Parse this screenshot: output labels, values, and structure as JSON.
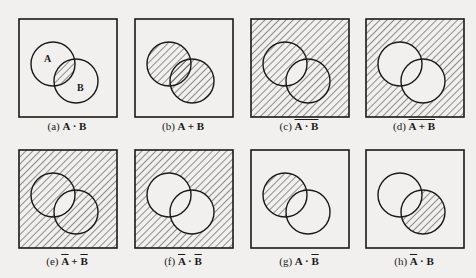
{
  "figure": {
    "colors": {
      "background": "#f1f0ee",
      "stroke": "#1a1a1a",
      "hatch": "#2a2a2a"
    },
    "circle_labels": {
      "a": "A",
      "b": "B"
    },
    "panels": [
      {
        "id": "a",
        "prefix": "(a)",
        "expr_parts": [
          {
            "t": "A",
            "bar": false
          },
          {
            "t": " · ",
            "bar": false
          },
          {
            "t": "B",
            "bar": false
          }
        ],
        "group_bar": false,
        "shaded": "A∩B"
      },
      {
        "id": "b",
        "prefix": "(b)",
        "expr_parts": [
          {
            "t": "A",
            "bar": false
          },
          {
            "t": " + ",
            "bar": false
          },
          {
            "t": "B",
            "bar": false
          }
        ],
        "group_bar": false,
        "shaded": "A∪B"
      },
      {
        "id": "c",
        "prefix": "(c)",
        "expr_parts": [
          {
            "t": "A · B",
            "bar": false
          }
        ],
        "group_bar": true,
        "shaded": "complement of A∩B"
      },
      {
        "id": "d",
        "prefix": "(d)",
        "expr_parts": [
          {
            "t": "A + B",
            "bar": false
          }
        ],
        "group_bar": true,
        "shaded": "complement of A∪B"
      },
      {
        "id": "e",
        "prefix": "(e)",
        "expr_parts": [
          {
            "t": "A",
            "bar": true
          },
          {
            "t": " + ",
            "bar": false
          },
          {
            "t": "B",
            "bar": true
          }
        ],
        "group_bar": false,
        "shaded": "complement of A∩B"
      },
      {
        "id": "f",
        "prefix": "(f)",
        "expr_parts": [
          {
            "t": "A",
            "bar": true
          },
          {
            "t": " · ",
            "bar": false
          },
          {
            "t": "B",
            "bar": true
          }
        ],
        "group_bar": false,
        "shaded": "complement of A∪B"
      },
      {
        "id": "g",
        "prefix": "(g)",
        "expr_parts": [
          {
            "t": "A",
            "bar": false
          },
          {
            "t": " · ",
            "bar": false
          },
          {
            "t": "B",
            "bar": true
          }
        ],
        "group_bar": false,
        "shaded": "A minus B"
      },
      {
        "id": "h",
        "prefix": "(h)",
        "expr_parts": [
          {
            "t": "A",
            "bar": true
          },
          {
            "t": " · ",
            "bar": false
          },
          {
            "t": "B",
            "bar": false
          }
        ],
        "group_bar": false,
        "shaded": "B minus A"
      }
    ]
  }
}
